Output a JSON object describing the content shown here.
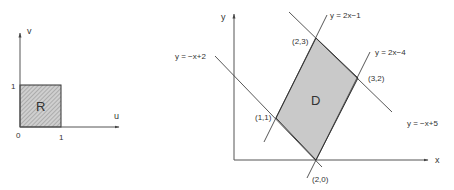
{
  "left_diagram": {
    "axis_labels": {
      "horizontal": "u",
      "vertical": "v"
    },
    "tick_labels": {
      "origin": "0",
      "u_one": "1",
      "v_one": "1"
    },
    "region_label": "R",
    "region": {
      "u_range": [
        0,
        1
      ],
      "v_range": [
        0,
        1
      ]
    }
  },
  "right_diagram": {
    "axis_labels": {
      "horizontal": "x",
      "vertical": "y"
    },
    "region_label": "D",
    "lines": [
      {
        "label": "y = 2x−1"
      },
      {
        "label": "y = 2x−4"
      },
      {
        "label": "y = −x+2"
      },
      {
        "label": "y = −x+5"
      }
    ],
    "vertices": [
      {
        "label": "(2,3)"
      },
      {
        "label": "(3,2)"
      },
      {
        "label": "(1,1)"
      },
      {
        "label": "(2,0)"
      }
    ]
  },
  "colors": {
    "fill": "#c8c8c8",
    "stroke": "#333333",
    "hatch": "#888888"
  }
}
